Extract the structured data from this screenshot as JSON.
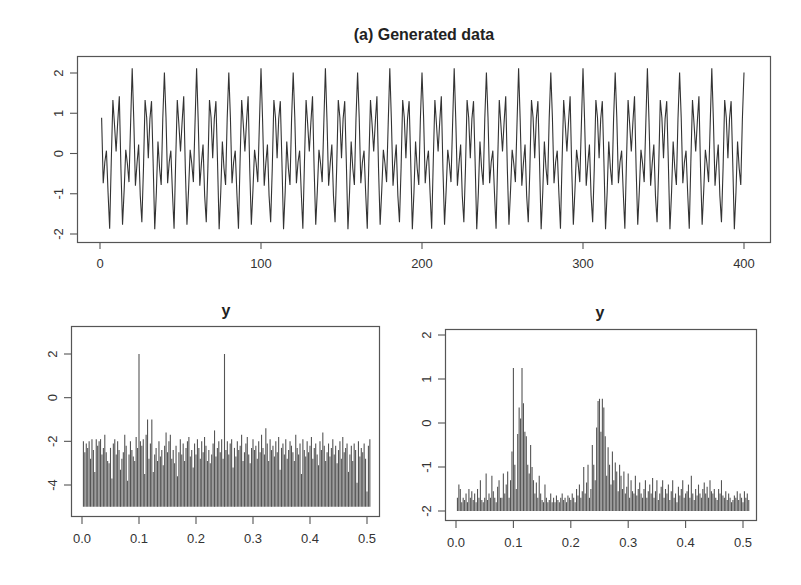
{
  "chart_data": [
    {
      "id": "generated",
      "type": "line",
      "title": "(a) Generated data",
      "xlabel": "",
      "ylabel": "",
      "xlim": [
        0,
        410
      ],
      "ylim": [
        -2.1,
        2.2
      ],
      "xticks": [
        0,
        100,
        200,
        300,
        400
      ],
      "xtick_labels": [
        "0",
        "100",
        "200",
        "300",
        "400"
      ],
      "yticks": [
        -2,
        -1,
        0,
        1,
        2
      ],
      "ytick_labels": [
        "-2",
        "-1",
        "0",
        "1",
        "2"
      ],
      "grid": false,
      "x_start": 1,
      "period_values": [
        0.81,
        -0.69,
        -0.31,
        0.19,
        -1.0,
        -1.81,
        -0.31,
        1.31,
        0.81,
        0.0,
        0.81,
        1.31,
        -0.31,
        -1.81,
        -1.0,
        0.19,
        -0.31,
        -0.69,
        0.81,
        2.0
      ],
      "n_points": 400,
      "noise_pattern": [
        0.08,
        -0.05,
        0.1,
        -0.12,
        0.03,
        -0.06,
        0.12,
        0.02,
        -0.09,
        0.05,
        -0.03,
        0.11,
        -0.07,
        0.04,
        0.09,
        -0.1,
        0.06,
        -0.02,
        -0.08,
        0.12,
        0.0,
        -0.11,
        0.07,
        0.03,
        -0.04,
        0.1,
        -0.06,
        0.02,
        0.08,
        -0.12,
        0.05,
        -0.01,
        0.09,
        -0.07,
        0.03,
        0.11,
        -0.05,
        -0.09,
        0.06,
        0.01
      ]
    },
    {
      "id": "spectrum-raw",
      "type": "bar",
      "title": "y",
      "xlabel": "",
      "ylabel": "",
      "xlim": [
        -0.01,
        0.51
      ],
      "ylim": [
        -5.2,
        3.3
      ],
      "baseline": -5.0,
      "xticks": [
        0.0,
        0.1,
        0.2,
        0.3,
        0.4,
        0.5
      ],
      "xtick_labels": [
        "0.0",
        "0.1",
        "0.2",
        "0.3",
        "0.4",
        "0.5"
      ],
      "yticks": [
        -4,
        -2,
        0,
        2
      ],
      "ytick_labels": [
        "-4",
        "-2",
        "0",
        "2"
      ],
      "grid": false,
      "freq_start": 0.0025,
      "freq_step": 0.0025,
      "peaks": [
        {
          "freq": 0.1,
          "value": 2.0
        },
        {
          "freq": 0.25,
          "value": 2.0
        },
        {
          "freq": 0.115,
          "value": -1.0
        }
      ],
      "values": [
        -2.0,
        -2.5,
        -2.1,
        -2.3,
        -2.0,
        -2.8,
        -1.9,
        -2.4,
        -3.4,
        -1.9,
        -2.2,
        -2.0,
        -1.9,
        -2.6,
        -2.3,
        -1.7,
        -2.5,
        -2.9,
        -3.0,
        -2.3,
        -3.7,
        -2.1,
        -1.9,
        -2.6,
        -2.0,
        -2.4,
        -3.3,
        -2.8,
        -2.5,
        -1.7,
        -2.2,
        -3.8,
        -2.6,
        -2.0,
        -2.4,
        -2.7,
        -2.9,
        -1.8,
        -2.3,
        -3.1,
        -2.0,
        -2.2,
        -1.9,
        -3.5,
        -1.7,
        -2.5,
        -2.8,
        -2.1,
        -1.0,
        -3.4,
        -2.6,
        -2.3,
        -2.9,
        -2.0,
        -2.7,
        -2.4,
        -3.1,
        -2.2,
        -1.6,
        -2.5,
        -2.0,
        -1.7,
        -2.8,
        -2.4,
        -3.0,
        -2.2,
        -3.6,
        -2.5,
        -1.9,
        -2.6,
        -2.1,
        -2.9,
        -2.3,
        -2.0,
        -1.8,
        -2.7,
        -2.4,
        -3.2,
        -2.1,
        -2.6,
        -1.9,
        -2.3,
        -2.8,
        -2.0,
        -2.5,
        -1.8,
        -2.2,
        -2.9,
        -2.4,
        -3.0,
        -2.6,
        -2.1,
        -1.5,
        -2.7,
        -2.3,
        -2.0,
        -2.5,
        -1.9,
        -2.8,
        -2.2,
        -2.4,
        -2.0,
        -2.6,
        -2.1,
        -1.9,
        -3.2,
        -2.3,
        -2.7,
        -2.0,
        -2.4,
        -2.2,
        -1.7,
        -2.9,
        -2.5,
        -2.1,
        -1.8,
        -2.6,
        -3.0,
        -2.3,
        -1.9,
        -2.4,
        -2.2,
        -2.8,
        -2.0,
        -2.5,
        -1.7,
        -2.3,
        -2.6,
        -1.4,
        -2.1,
        -2.9,
        -1.9,
        -2.4,
        -2.2,
        -2.7,
        -2.0,
        -2.5,
        -1.8,
        -3.3,
        -2.3,
        -2.1,
        -2.6,
        -1.9,
        -2.8,
        -2.4,
        -2.0,
        -2.2,
        -2.5,
        -2.9,
        -1.7,
        -2.3,
        -2.6,
        -2.1,
        -3.5,
        -1.9,
        -2.4,
        -2.7,
        -2.0,
        -2.5,
        -2.2,
        -1.8,
        -2.8,
        -2.3,
        -2.1,
        -2.6,
        -3.1,
        -2.0,
        -2.4,
        -1.6,
        -2.2,
        -2.9,
        -2.5,
        -2.1,
        -2.7,
        -2.3,
        -1.9,
        -2.6,
        -2.2,
        -3.0,
        -2.4,
        -2.0,
        -2.8,
        -1.8,
        -2.5,
        -2.3,
        -2.1,
        -3.4,
        -2.6,
        -2.2,
        -2.9,
        -2.1,
        -2.4,
        -3.9,
        -2.0,
        -2.7,
        -2.3,
        -2.5,
        -2.1,
        -2.8,
        -4.3,
        -2.2,
        -1.9
      ]
    },
    {
      "id": "spectrum-smoothed",
      "type": "bar",
      "title": "y",
      "xlabel": "",
      "ylabel": "",
      "xlim": [
        -0.01,
        0.51
      ],
      "ylim": [
        -2.1,
        2.2
      ],
      "baseline": -2.0,
      "xticks": [
        0.0,
        0.1,
        0.2,
        0.3,
        0.4,
        0.5
      ],
      "xtick_labels": [
        "0.0",
        "0.1",
        "0.2",
        "0.3",
        "0.4",
        "0.5"
      ],
      "yticks": [
        -2,
        -1,
        0,
        1,
        2
      ],
      "ytick_labels": [
        "-2",
        "-1",
        "0",
        "1",
        "2"
      ],
      "grid": false,
      "freq_start": 0.0025,
      "freq_step": 0.0025,
      "peaks": [
        {
          "freq": 0.1,
          "value": 1.25
        },
        {
          "freq": 0.25,
          "value": 0.55
        }
      ],
      "values": [
        -1.7,
        -1.4,
        -1.5,
        -1.8,
        -1.7,
        -1.75,
        -1.6,
        -1.8,
        -1.5,
        -1.7,
        -1.55,
        -1.75,
        -1.6,
        -1.8,
        -1.5,
        -1.7,
        -1.3,
        -1.75,
        -1.8,
        -1.7,
        -1.15,
        -1.75,
        -1.6,
        -1.7,
        -1.2,
        -1.55,
        -1.7,
        -1.8,
        -1.45,
        -1.3,
        -1.7,
        -1.7,
        -1.15,
        -1.6,
        -1.4,
        -1.1,
        -1.7,
        -1.3,
        -0.65,
        -1.2,
        -0.95,
        -1.5,
        -0.25,
        0.35,
        0.1,
        1.25,
        0.45,
        -0.2,
        -0.3,
        -0.95,
        -1.15,
        -0.5,
        -1.0,
        -1.3,
        -1.6,
        -1.35,
        -1.7,
        -1.2,
        -1.6,
        -1.75,
        -1.8,
        -1.4,
        -1.7,
        -1.8,
        -1.75,
        -1.6,
        -1.8,
        -1.7,
        -1.8,
        -1.65,
        -1.75,
        -1.8,
        -1.7,
        -1.6,
        -1.75,
        -1.7,
        -1.8,
        -1.65,
        -1.7,
        -1.75,
        -1.6,
        -1.7,
        -1.8,
        -1.5,
        -1.65,
        -1.4,
        -1.7,
        -1.55,
        -1.0,
        -1.6,
        -1.35,
        -0.95,
        -1.7,
        -1.5,
        -0.5,
        -0.95,
        -1.3,
        -0.1,
        0.5,
        0.3,
        -0.2,
        0.55,
        0.35,
        -0.3,
        -1.2,
        -0.55,
        -0.95,
        -1.4,
        -0.65,
        -1.3,
        -0.9,
        -1.1,
        -1.55,
        -0.95,
        -1.2,
        -1.5,
        -1.1,
        -1.6,
        -1.45,
        -1.15,
        -1.7,
        -1.3,
        -1.55,
        -1.6,
        -1.2,
        -1.65,
        -1.5,
        -1.35,
        -1.6,
        -1.7,
        -1.5,
        -1.3,
        -1.7,
        -1.55,
        -1.4,
        -1.6,
        -1.25,
        -1.7,
        -1.55,
        -1.3,
        -1.75,
        -1.6,
        -1.45,
        -1.3,
        -1.7,
        -1.5,
        -1.6,
        -1.4,
        -1.75,
        -1.55,
        -1.3,
        -1.7,
        -1.6,
        -1.8,
        -1.45,
        -1.65,
        -1.5,
        -1.3,
        -1.7,
        -1.6,
        -1.55,
        -1.4,
        -1.7,
        -1.2,
        -1.6,
        -1.75,
        -1.5,
        -1.65,
        -1.4,
        -1.6,
        -1.7,
        -1.5,
        -1.35,
        -1.6,
        -1.45,
        -1.7,
        -1.3,
        -1.55,
        -1.6,
        -1.5,
        -1.7,
        -1.75,
        -1.5,
        -1.6,
        -1.3,
        -1.65,
        -1.7,
        -1.55,
        -1.75,
        -1.6,
        -1.7,
        -1.8,
        -1.75,
        -1.65,
        -1.7,
        -1.55,
        -1.75,
        -1.6,
        -1.7,
        -1.8,
        -1.55,
        -1.7,
        -1.6,
        -1.75
      ]
    }
  ]
}
